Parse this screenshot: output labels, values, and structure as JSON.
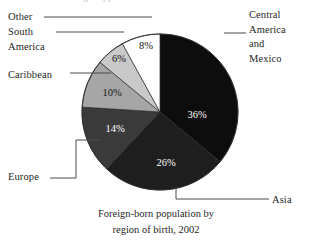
{
  "chart_data": {
    "type": "pie",
    "title_line1": "Foreign-born population by",
    "title_line2": "region of birth, 2002",
    "start_angle_deg": 0,
    "direction": "clockwise",
    "categories": [
      "Central America and Mexico",
      "Asia",
      "Europe",
      "Caribbean",
      "South America",
      "Other"
    ],
    "values": [
      36,
      26,
      14,
      10,
      6,
      8
    ],
    "value_labels": [
      "36%",
      "26%",
      "14%",
      "10%",
      "6%",
      "8%"
    ],
    "slice_colors": [
      "#0d0d0d",
      "#1e1e1e",
      "#3a3a3a",
      "#a6a6a6",
      "#c9c9c9",
      "#ffffff"
    ],
    "slice_label_colors": [
      "#ffffff",
      "#ffffff",
      "#ffffff",
      "#141414",
      "#141414",
      "#141414"
    ],
    "legend": "none",
    "grid": false,
    "slices": [
      {
        "name": "Central America and Mexico",
        "value": 36,
        "label": "36%",
        "fill": "#0d0d0d",
        "text_fill": "#ffffff"
      },
      {
        "name": "Asia",
        "value": 26,
        "label": "26%",
        "fill": "#1e1e1e",
        "text_fill": "#ffffff"
      },
      {
        "name": "Europe",
        "value": 14,
        "label": "14%",
        "fill": "#3a3a3a",
        "text_fill": "#ffffff"
      },
      {
        "name": "Caribbean",
        "value": 10,
        "label": "10%",
        "fill": "#a6a6a6",
        "text_fill": "#141414"
      },
      {
        "name": "South America",
        "value": 6,
        "label": "6%",
        "fill": "#c9c9c9",
        "text_fill": "#141414"
      },
      {
        "name": "Other",
        "value": 8,
        "label": "8%",
        "fill": "#ffffff",
        "text_fill": "#141414"
      }
    ]
  },
  "labels": {
    "other": "Other",
    "south_america_line1": "South",
    "south_america_line2": "America",
    "caribbean": "Caribbean",
    "europe": "Europe",
    "central_line1": "Central",
    "central_line2": "America",
    "central_line3": "and",
    "central_line4": "Mexico",
    "asia": "Asia"
  },
  "percent_labels": {
    "central": "36%",
    "asia": "26%",
    "europe": "14%",
    "caribbean": "10%",
    "south_america": "6%",
    "other": "8%"
  },
  "caption": {
    "line1": "Foreign-born population by",
    "line2": "region of birth, 2002"
  },
  "colors": {
    "background": "#ffffff",
    "text": "#1f1f1f",
    "leader_line": "#4a4a4a",
    "slice_outline": "#2a2a2a"
  },
  "cropped_header": "  g      pp"
}
